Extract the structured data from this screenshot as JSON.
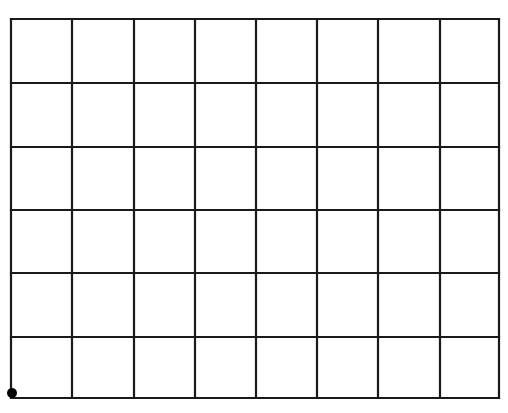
{
  "diagram": {
    "type": "grid",
    "columns": 8,
    "rows": 6,
    "line_color": "#1a1a1a",
    "background_color": "#ffffff",
    "bounds": {
      "left": 11,
      "top": 19,
      "right": 499,
      "bottom": 398
    },
    "vertical_lines_x": [
      11,
      72,
      134,
      195,
      256,
      317,
      378,
      440,
      499
    ],
    "horizontal_lines_y": [
      19,
      83,
      147,
      210,
      273,
      337,
      398
    ],
    "marker": {
      "shape": "dot",
      "position": "bottom-left corner",
      "cx": 12,
      "cy": 393,
      "r": 5,
      "color": "#000000"
    }
  }
}
